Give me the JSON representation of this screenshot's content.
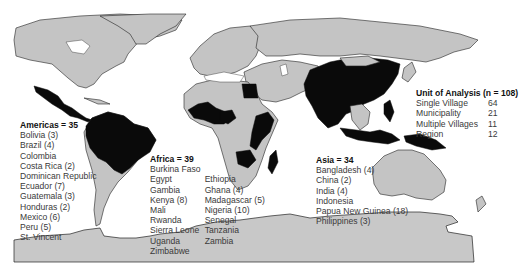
{
  "map": {
    "title": "Study locations by region",
    "land_color": "#c4c4c4",
    "highlight_color": "#0a0a0a",
    "background_color": "#ffffff"
  },
  "americas": {
    "heading": "Americas = 35",
    "countries": [
      "Bolivia (3)",
      "Brazil (4)",
      "Colombia",
      "Costa Rica (2)",
      "Dominican Republic",
      "Ecuador (7)",
      "Guatemala (3)",
      "Honduras (2)",
      "Mexico (6)",
      "Peru (5)",
      "St. Vincent"
    ]
  },
  "africa": {
    "heading": "Africa = 39",
    "col1": [
      "Burkina Faso",
      "Egypt",
      "Gambia",
      "Kenya (8)",
      "Mali",
      "Rwanda",
      "Sierra Leone",
      "Uganda",
      "Zimbabwe"
    ],
    "col2": [
      "Ethiopia",
      "Ghana (4)",
      "Madagascar (5)",
      "Nigeria (10)",
      "Senegal",
      "Tanzania",
      "Zambia"
    ]
  },
  "asia": {
    "heading": "Asia = 34",
    "countries": [
      "Bangladesh (4)",
      "China (2)",
      "India (4)",
      "Indonesia",
      "Papua New Guinea (18)",
      "Philippines (3)"
    ]
  },
  "unit_of_analysis": {
    "heading": "Unit of Analysis (n = 108)",
    "rows": [
      {
        "label": "Single Village",
        "value": "64"
      },
      {
        "label": "Municipality",
        "value": "21"
      },
      {
        "label": "Multiple Villages",
        "value": "11"
      },
      {
        "label": "Region",
        "value": "12"
      }
    ]
  }
}
